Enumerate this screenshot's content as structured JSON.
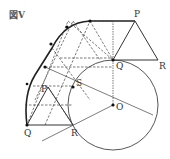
{
  "figure": {
    "title": "図V",
    "labels": {
      "P_top": "P",
      "Q_top": "Q",
      "R_top": "R",
      "S": "S",
      "O": "O",
      "P_bottom": "P",
      "Q_bottom": "Q",
      "R_bottom": "R"
    },
    "colors": {
      "line": "#333333",
      "dashed": "#444444",
      "background": "#ffffff"
    }
  }
}
